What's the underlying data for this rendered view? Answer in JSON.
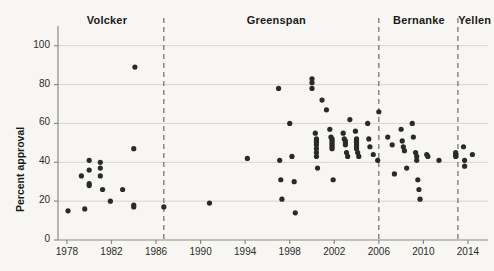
{
  "chart_data": {
    "type": "scatter",
    "title": "",
    "xlabel": "",
    "ylabel": "Percent approval",
    "xlim": [
      1977.2,
      2015.8
    ],
    "ylim": [
      0,
      105
    ],
    "xticks": [
      1978,
      1982,
      1986,
      1990,
      1994,
      1998,
      2002,
      2006,
      2010,
      2014
    ],
    "xtick_labels": [
      "1978",
      "1982",
      "1986",
      "1990",
      "1994",
      "1998",
      "2002",
      "2006",
      "2010",
      "2014"
    ],
    "yticks": [
      0,
      20,
      40,
      60,
      80,
      100
    ],
    "ytick_labels": [
      "0",
      "20",
      "40",
      "60",
      "80",
      "100"
    ],
    "grid": "horizontal",
    "grid_color": "#d8d6cb",
    "marker_color": "#2a2a28",
    "marker_size": 2.6,
    "background": "#f7f6f2",
    "axis_color": "#8c8a80",
    "legend": "none",
    "annotations": [
      {
        "label": "Volcker",
        "x": 1981.6,
        "type": "era-label"
      },
      {
        "label": "Greenspan",
        "x": 1996.8,
        "type": "era-label"
      },
      {
        "label": "Bernanke",
        "x": 2009.6,
        "type": "era-label"
      },
      {
        "label": "Yellen",
        "x": 2014.6,
        "type": "era-label"
      }
    ],
    "dividers": [
      {
        "x": 1986.7,
        "style": "dashed",
        "color": "#6f6d64"
      },
      {
        "x": 2006.0,
        "style": "dashed",
        "color": "#6f6d64"
      },
      {
        "x": 2013.1,
        "style": "dashed",
        "color": "#6f6d64"
      }
    ],
    "points": [
      {
        "x": 1978.1,
        "y": 15
      },
      {
        "x": 1979.3,
        "y": 33
      },
      {
        "x": 1980.0,
        "y": 41
      },
      {
        "x": 1980.0,
        "y": 36
      },
      {
        "x": 1980.0,
        "y": 29
      },
      {
        "x": 1980.0,
        "y": 28
      },
      {
        "x": 1979.6,
        "y": 16
      },
      {
        "x": 1981.0,
        "y": 40
      },
      {
        "x": 1981.0,
        "y": 37
      },
      {
        "x": 1981.0,
        "y": 33
      },
      {
        "x": 1981.2,
        "y": 26
      },
      {
        "x": 1981.9,
        "y": 20
      },
      {
        "x": 1983.0,
        "y": 26
      },
      {
        "x": 1984.0,
        "y": 47
      },
      {
        "x": 1984.0,
        "y": 18
      },
      {
        "x": 1984.0,
        "y": 17
      },
      {
        "x": 1984.1,
        "y": 89
      },
      {
        "x": 1986.7,
        "y": 17
      },
      {
        "x": 1990.8,
        "y": 19
      },
      {
        "x": 1994.2,
        "y": 42
      },
      {
        "x": 1997.0,
        "y": 78
      },
      {
        "x": 1997.1,
        "y": 41
      },
      {
        "x": 1997.2,
        "y": 31
      },
      {
        "x": 1997.3,
        "y": 21
      },
      {
        "x": 1998.0,
        "y": 60
      },
      {
        "x": 1998.2,
        "y": 43
      },
      {
        "x": 1998.4,
        "y": 30
      },
      {
        "x": 1998.5,
        "y": 14
      },
      {
        "x": 2000.0,
        "y": 83
      },
      {
        "x": 2000.0,
        "y": 81
      },
      {
        "x": 2000.0,
        "y": 78
      },
      {
        "x": 2000.3,
        "y": 55
      },
      {
        "x": 2000.4,
        "y": 52
      },
      {
        "x": 2000.4,
        "y": 51
      },
      {
        "x": 2000.4,
        "y": 50
      },
      {
        "x": 2000.4,
        "y": 49
      },
      {
        "x": 2000.4,
        "y": 47
      },
      {
        "x": 2000.4,
        "y": 45
      },
      {
        "x": 2000.4,
        "y": 43
      },
      {
        "x": 2000.5,
        "y": 37
      },
      {
        "x": 2000.9,
        "y": 72
      },
      {
        "x": 2001.3,
        "y": 67
      },
      {
        "x": 2001.6,
        "y": 57
      },
      {
        "x": 2001.7,
        "y": 53
      },
      {
        "x": 2001.8,
        "y": 52
      },
      {
        "x": 2001.8,
        "y": 51
      },
      {
        "x": 2001.8,
        "y": 50
      },
      {
        "x": 2001.8,
        "y": 49
      },
      {
        "x": 2001.8,
        "y": 48
      },
      {
        "x": 2001.8,
        "y": 47
      },
      {
        "x": 2001.9,
        "y": 31
      },
      {
        "x": 2002.8,
        "y": 55
      },
      {
        "x": 2002.9,
        "y": 52
      },
      {
        "x": 2003.0,
        "y": 51
      },
      {
        "x": 2003.0,
        "y": 50
      },
      {
        "x": 2003.0,
        "y": 49
      },
      {
        "x": 2003.1,
        "y": 45
      },
      {
        "x": 2003.2,
        "y": 43
      },
      {
        "x": 2003.4,
        "y": 62
      },
      {
        "x": 2003.9,
        "y": 56
      },
      {
        "x": 2004.0,
        "y": 52
      },
      {
        "x": 2004.0,
        "y": 51
      },
      {
        "x": 2004.0,
        "y": 50
      },
      {
        "x": 2004.0,
        "y": 49
      },
      {
        "x": 2004.0,
        "y": 48
      },
      {
        "x": 2004.0,
        "y": 47
      },
      {
        "x": 2004.1,
        "y": 45
      },
      {
        "x": 2004.2,
        "y": 43
      },
      {
        "x": 2005.0,
        "y": 60
      },
      {
        "x": 2005.1,
        "y": 52
      },
      {
        "x": 2005.2,
        "y": 48
      },
      {
        "x": 2005.5,
        "y": 44
      },
      {
        "x": 2005.9,
        "y": 41
      },
      {
        "x": 2006.0,
        "y": 66
      },
      {
        "x": 2006.8,
        "y": 53
      },
      {
        "x": 2007.2,
        "y": 49
      },
      {
        "x": 2007.4,
        "y": 34
      },
      {
        "x": 2008.0,
        "y": 57
      },
      {
        "x": 2008.1,
        "y": 51
      },
      {
        "x": 2008.2,
        "y": 48
      },
      {
        "x": 2008.3,
        "y": 46
      },
      {
        "x": 2008.5,
        "y": 37
      },
      {
        "x": 2009.0,
        "y": 60
      },
      {
        "x": 2009.1,
        "y": 53
      },
      {
        "x": 2009.3,
        "y": 45
      },
      {
        "x": 2009.4,
        "y": 43
      },
      {
        "x": 2009.4,
        "y": 41
      },
      {
        "x": 2009.5,
        "y": 31
      },
      {
        "x": 2009.6,
        "y": 26
      },
      {
        "x": 2009.7,
        "y": 21
      },
      {
        "x": 2010.3,
        "y": 44
      },
      {
        "x": 2010.4,
        "y": 43
      },
      {
        "x": 2011.4,
        "y": 41
      },
      {
        "x": 2012.9,
        "y": 45
      },
      {
        "x": 2012.9,
        "y": 44
      },
      {
        "x": 2012.9,
        "y": 43
      },
      {
        "x": 2013.6,
        "y": 48
      },
      {
        "x": 2013.7,
        "y": 41
      },
      {
        "x": 2013.7,
        "y": 38
      },
      {
        "x": 2014.4,
        "y": 44
      }
    ]
  }
}
